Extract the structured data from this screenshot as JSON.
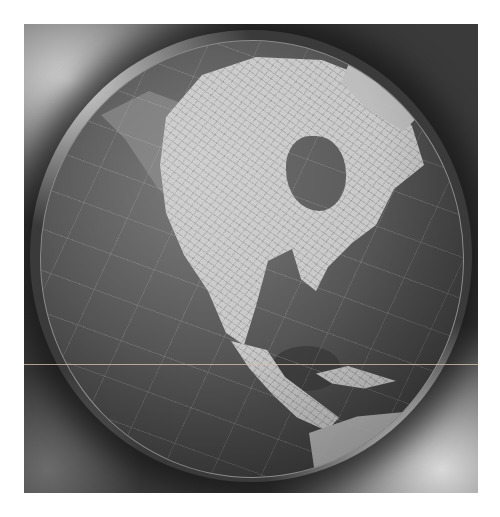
{
  "image": {
    "subject": "globe",
    "description": "Grayscale photograph of a terrestrial globe showing North America, Central America, the Caribbean and northern South America against a cloudy dark background",
    "regions_visible": [
      "North America",
      "Greenland",
      "Hudson Bay",
      "Gulf of Mexico",
      "Central America",
      "Caribbean",
      "South America"
    ],
    "colors": {
      "background": "#3a3a3a",
      "ocean": "#555555",
      "land": "#c9c9c9",
      "page": "#ffffff"
    }
  }
}
